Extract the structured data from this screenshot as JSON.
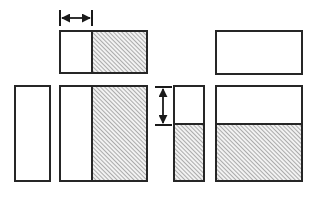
{
  "figure": {
    "canvas": {
      "width": 314,
      "height": 197
    },
    "colors": {
      "stroke": "#262626",
      "fill_plain": "#ffffff",
      "hatch_line": "#8c8c8c",
      "hatch_background": "#f2f2f2",
      "background": "#ffffff",
      "arrow": "#1a1a1a"
    },
    "stroke_width": 2,
    "hatch": {
      "pattern_name": "diagonal-hatch-45",
      "direction": "lower-left-to-upper-right",
      "angle_degrees": 45,
      "spacing_px": 3,
      "line_width_px": 1.4
    }
  },
  "shapes": [
    {
      "name": "top-left-rectangle",
      "role": "wide rectangle split vertically into unshaded left part and hatched right part",
      "x": 60,
      "y": 31,
      "width": 87,
      "height": 42,
      "parts": [
        {
          "name": "unshaded-part",
          "fill": "plain",
          "x": 60,
          "y": 31,
          "width": 32,
          "height": 42
        },
        {
          "name": "hatched-part",
          "fill": "hatched",
          "x": 92,
          "y": 31,
          "width": 55,
          "height": 42
        }
      ],
      "divider": {
        "orientation": "vertical",
        "at": 92
      }
    },
    {
      "name": "top-right-rectangle",
      "role": "wide unshaded rectangle",
      "x": 216,
      "y": 31,
      "width": 86,
      "height": 43,
      "parts": [
        {
          "name": "unshaded-part",
          "fill": "plain",
          "x": 216,
          "y": 31,
          "width": 86,
          "height": 43
        }
      ],
      "divider": null
    },
    {
      "name": "bottom-far-left-rectangle",
      "role": "narrow tall unshaded rectangle",
      "x": 15,
      "y": 86,
      "width": 35,
      "height": 95,
      "parts": [
        {
          "name": "unshaded-part",
          "fill": "plain",
          "x": 15,
          "y": 86,
          "width": 35,
          "height": 95
        }
      ],
      "divider": null
    },
    {
      "name": "bottom-left-rectangle",
      "role": "tall rectangle split vertically into unshaded left part and hatched right part",
      "x": 60,
      "y": 86,
      "width": 87,
      "height": 95,
      "parts": [
        {
          "name": "unshaded-part",
          "fill": "plain",
          "x": 60,
          "y": 86,
          "width": 32,
          "height": 95
        },
        {
          "name": "hatched-part",
          "fill": "hatched",
          "x": 92,
          "y": 86,
          "width": 55,
          "height": 95
        }
      ],
      "divider": {
        "orientation": "vertical",
        "at": 92
      }
    },
    {
      "name": "bottom-middle-rectangle",
      "role": "narrow tall rectangle split horizontally into unshaded top part and hatched bottom part",
      "x": 174,
      "y": 86,
      "width": 30,
      "height": 95,
      "parts": [
        {
          "name": "unshaded-part",
          "fill": "plain",
          "x": 174,
          "y": 86,
          "width": 30,
          "height": 38
        },
        {
          "name": "hatched-part",
          "fill": "hatched",
          "x": 174,
          "y": 124,
          "width": 30,
          "height": 57
        }
      ],
      "divider": {
        "orientation": "horizontal",
        "at": 124
      }
    },
    {
      "name": "bottom-right-rectangle",
      "role": "large rectangle split horizontally into unshaded top part and hatched bottom part",
      "x": 216,
      "y": 86,
      "width": 86,
      "height": 95,
      "parts": [
        {
          "name": "unshaded-part",
          "fill": "plain",
          "x": 216,
          "y": 86,
          "width": 86,
          "height": 38
        },
        {
          "name": "hatched-part",
          "fill": "hatched",
          "x": 216,
          "y": 124,
          "width": 86,
          "height": 57
        }
      ],
      "divider": {
        "orientation": "horizontal",
        "at": 124
      }
    }
  ],
  "dimensions": [
    {
      "name": "horizontal-dimension-arrow",
      "orientation": "horizontal",
      "label": "",
      "measures": "width of unshaded left part of top-left rectangle",
      "line_y": 18,
      "from": 60,
      "to": 92,
      "length_px": 32,
      "extension_ticks": [
        {
          "x": 60,
          "y1": 10,
          "y2": 26
        },
        {
          "x": 92,
          "y1": 10,
          "y2": 26
        }
      ],
      "arrowheads": "both"
    },
    {
      "name": "vertical-dimension-arrow",
      "orientation": "vertical",
      "label": "",
      "measures": "height of unshaded top part of bottom-middle rectangle",
      "line_x": 163,
      "from": 87,
      "to": 125,
      "length_px": 38,
      "extension_ticks": [
        {
          "y": 87,
          "x1": 155,
          "x2": 172
        },
        {
          "y": 125,
          "x1": 155,
          "x2": 172
        }
      ],
      "arrowheads": "both"
    }
  ]
}
